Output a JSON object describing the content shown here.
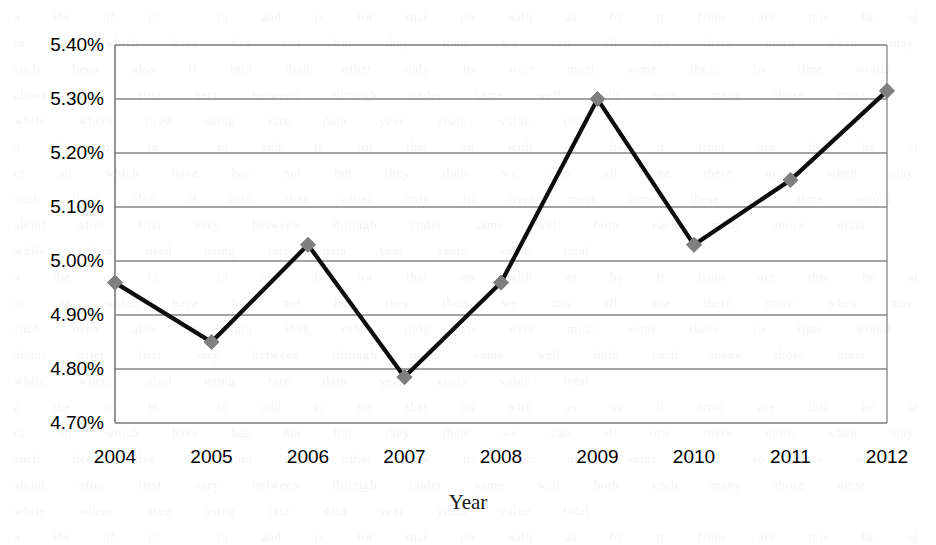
{
  "chart_data": {
    "type": "line",
    "title": "",
    "subtitle": "",
    "xlabel": "Year",
    "ylabel": "",
    "categories": [
      "2004",
      "2005",
      "2006",
      "2007",
      "2008",
      "2009",
      "2010",
      "2011",
      "2012"
    ],
    "values": [
      4.96,
      4.85,
      5.03,
      4.785,
      4.96,
      5.3,
      5.03,
      5.15,
      5.315
    ],
    "value_format": "percent",
    "value_suffix": "%",
    "series": [
      {
        "name": "",
        "values": [
          4.96,
          4.85,
          5.03,
          4.785,
          4.96,
          5.3,
          5.03,
          5.15,
          5.315
        ]
      }
    ],
    "ylim": [
      4.7,
      5.4
    ],
    "ytick_step": 0.1,
    "ytick_labels": [
      "5.40%",
      "5.30%",
      "5.20%",
      "5.10%",
      "5.00%",
      "4.90%",
      "4.80%",
      "4.70%"
    ],
    "ytick_values": [
      5.4,
      5.3,
      5.2,
      5.1,
      5.0,
      4.9,
      4.8,
      4.7
    ],
    "xtick_labels": [
      "2004",
      "2005",
      "2006",
      "2007",
      "2008",
      "2009",
      "2010",
      "2011",
      "2012"
    ],
    "grid": true,
    "grid_axis": "y",
    "legend": false,
    "legend_position": "none",
    "marker": "diamond",
    "marker_color": "#7f7f7f",
    "line_color": "#0d0d0d",
    "grid_color": "#868686",
    "border_color": "#7a7a7a",
    "plot_background": "#ffffff"
  },
  "ghost_text": "a   the   of   in  .   to   and   is   for   that   on   with   as   by   it   from   are   this   be   at   or   an   which   have   has   not   but   they   their   we   can   all   one   there   more   when   may   such   been   also   if   into   than   other   only   its   over   most   some   these   so   time   would   about   after   first   very   between   through   under   same   well   both   each   many   those   must   while   where   used   using   rate   data   year   years   value   total\na   the   of   in  .   to   and   is   for   that   on   with   as   by   it   from   are   this   be   at   or   an   which   have   has   not   but   they   their   we   can   all   one   there   more   when   may   such   been   also   if   into   than   other   only   its   over   most   some   these   so   time   would   about   after   first   very   between   through   under   same   well   both   each   many   those   must   while   where   used   using   rate   data   year   years   value   total\na   the   of   in  .   to   and   is   for   that   on   with   as   by   it   from   are   this   be   at   or   an   which   have   has   not   but   they   their   we   can   all   one   there   more   when   may   such   been   also   if   into   than   other   only   its   over   most   some   these   so   time   would   about   after   first   very   between   through   under   same   well   both   each   many   those   must   while   where   used   using   rate   data   year   years   value   total\na   the   of   in  .   to   and   is   for   that   on   with   as   by   it   from   are   this   be   at   or   an   which   have   has   not   but   they   their   we   can   all   one   there   more   when   may   such   been   also   if   into   than   other   only   its   over   most   some   these   so   time   would   about   after   first   very   between   through   under   same   well   both   each   many   those   must   while   where   used   using   rate   data   year   years   value   total\na   the   of   in  .   to   and   is   for   that   on   with   as   by   it   from   are   this   be   at   or   an   which   have   has   not   but   they   their   we   can   all   one   there   more   when   may   such   been   also   if   into   than   other   only   its   over   most   some   these   so   time   would   about   after   first   very   between   through   under   same   well   both   each   many   those   must   while   where   used   using   rate   data   year   years   value   total\na   the   of   in  .   to   and   is   for   that   on   with   as   by   it   from   are   this   be   at   or   an   which   have   has   not   but   they   their   we   can   all   one   there   more   when   may   such   been   also   if   into   than   other   only   its   over   most   some   these   so   time   would   about   after   first   very   between   through   under   same   well   both   each   many   those   must   while   where   used   using   rate   data   year   years   value   total\na   the   of   in  .   to   and   is   for   that   on   with   as   by   it   from   are   this   be   at   or   an   which   have   has   not   but   they   their   we   can   all   one   there   more   when   may   such   been   also   if   into   than   other   only   its   over   most   some   these   so   time   would   about   after   first   very   between   through   under   same   well   both   each   many   those   must   while   where   used   using   rate   data   year   years   value   total\na   the   of   in  .   to   and   is   for   that   on   with   as   by   it   from   are   this   be   at   or   an   which   have   has   not   but   they   their   we   can   all   one   there   more   when   may   such   been   also   if   into   than   other   only   its   over   most   some   these   so   time   would   about   after   first   very   between   through   under   same   well   both   each   many   those   must   while   where   used   using   rate   data   year   years   value   total\na   the   of   in  .   to   and   is   for   that   on   with   as   by   it   from   are   this   be   at   or   an   which   have   has   not   but   they   their   we   can   all   one   there   more   when   may   such   been   also   if   into   than   other   only   its   over   most   some   these   so   time   would   about   after   first   very   between   through   under   same   well   both   each   many   those   must   while   where   used   using   rate   data   year   years   value   total\na   the   of   in  .   to   and   is   for   that   on   with   as   by   it   from   are   this   be   at   or   an   which   have   has   not   but   they   their   we   can   all   one   there   more   when   may   such   been   also   if   into   than   other   only   its   over   most   some   these   so   time   would   about   after   first   very   between   through   under   same   well   both   each   many   those   must   while   where   used   using   rate   data   year   years   value   total\na   the   of   in  .   to   and   is   for   that   on   with   as   by   it   from   are   this   be   at   or   an   which   have   has   not   but   they   their   we   can   all   one   there   more   when   may   such   been   also   if   into   than   other   only   its   over   most   some   these   so   time   would   about   after   first   very   between   through   under   same   well   both   each   many   those   must   while   where   used   using   rate   data   year   years   value   total\na   the   of   in  .   to   and   is   for   that   on   with   as   by   it   from   are   this   be   at   or   an   which   have   has   not   but   they   their   we   can   all   one   there   more   when   may   such   been   also   if   into   than   other   only   its   over   most   some   these   so   time   would   about   after   first   very   between   through   under   same   well   both   each   many   those   must   while   where   used   using   rate   data   year   years   value   total\na   the   of   in  .   to   and   is   for   that   on   with   as   by   it   from   are   this   be   at   or   an   which   have   has   not   but   they   their   we   can   all   one   there   more   when   may   such   been   also   if   into   than   other   only   its   over   most   some   these   so   time   would   about   after   first   very   between   through   under   same   well   both   each   many   those   must   while   where   used   using   rate   data   year   years   value   total\na   the   of   in  .   to   and   is   for   that   on   with   as   by   it   from   are   this   be   at   or   an   which   have   has   not   but   they   their   we   can   all   one   there   more   when   may   such   been   also   if   into   than   other   only   its   over   most   some   these   so   time   would   about   after   first   very   between   through   under   same   well   both   each   many   those   must   while   where   used   using   rate   data   year   years   value   total\na   the   of   in  .   to   and   is   for   that   on   with   as   by   it   from   are   this   be   at   or   an   which   have   has   not   but   they   their   we   can   all   one   there   more   when   may   such   been   also   if   into   than   other   only   its   over   most   some   these   so   time   would   about   after   first   very   between   through   under   same   well   both   each   many   those   must   while   where   used   using   rate   data   year   years   value   total\na   the   of   in  .   to   and   is   for   that   on   with   as   by   it   from   are   this   be   at   or   an   which   have   has   not   but   they   their   we   can   all   one   there   more   when   may   such   been   also   if   into   than   other   only   its   over   most   some   these   so   time   would   about   after   first   very   between   through   under   same   well   both   each   many   those   must   while   where   used   using   rate   data   year   years   value   total\na   the   of   in  .   to   and   is   for   that   on   with   as   by   it   from   are   this   be   at   or   an   which   have   has   not   but   they   their   we   can   all   one   there   more   when   may   such   been   also   if   into   than   other   only   its   over   most   some   these   so   time   would   about   after   first   very   between   through   under   same   well   both   each   many   those   must   while   where   used   using   rate   data   year   years   value   total\na   the   of   in  .   to   and   is   for   that   on   with   as   by   it   from   are   this   be   at   or   an   which   have   has   not   but   they   their   we   can   all   one   there   more   when   may   such   been   also   if   into   than   other   only   its   over   most   some   these   so   time   would   about   after   first   very   between   through   under   same   well   both   each   many   those   must   while   where   used   using   rate   data   year   years   value   total\na   the   of   in  .   to   and   is   for   that   on   with   as   by   it   from   are   this   be   at   or   an   which   have   has   not   but   they   their   we   can   all   one   there   more   when   may   such   been   also   if   into   than   other   only   its   over   most   some   these   so   time   would   about   after   first   very   between   through   under   same   well   both   each   many   those   must   while   where   used   using   rate   data   year   years   value   total\na   the   of   in  .   to   and   is   for   that   on   with   as   by   it   from   are   this   be   at   or   an   which   have   has   not   but   they   their   we   can   all   one   there   more   when   may   such   been   also   if   into   than   other   only   its   over   most   some   these   so   time   would   about   after   first   very   between   through   under   same   well   both   each   many   those   must   while   where   used   using   rate   data   year   years   value   total\na   the   of   in  .   to   and   is   for   that   on   with   as   by   it   from   are   this   be   at   or   an   which   have   has   not   but   they   their   we   can   all   one   there   more   when   may   such   been   also   if   into   than   other   only   its   over   most   some   these   so   time   would   about   after   first   very   between   through   under   same   well   both   each   many   those   must   while   where   used   using   rate   data   year   years   value   total"
}
